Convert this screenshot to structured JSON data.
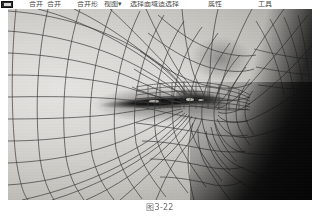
{
  "page": {
    "background_color": "#ffffff",
    "kind": "scanned-book-figure"
  },
  "toolbar": {
    "visible": true,
    "note": "cropped menu/toolbar strip, only bottom sliver of glyphs visible",
    "app_icon_name": "app-icon",
    "items": [
      {
        "label": "合并",
        "name": "toolbar-item-1"
      },
      {
        "label": "合并",
        "name": "toolbar-item-2"
      },
      {
        "label": "合并形",
        "name": "toolbar-item-3"
      },
      {
        "label": "视图▾",
        "name": "toolbar-item-4"
      },
      {
        "label": "选择面域适选择",
        "name": "toolbar-item-5"
      },
      {
        "label": "属性",
        "name": "toolbar-item-6"
      },
      {
        "label": "工具",
        "name": "toolbar-item-7"
      }
    ]
  },
  "figure": {
    "name": "wireframe-face-mesh-render",
    "alt": "Grayscale 3D wireframe mesh render of a human mouth and lips, quad polygon mesh overlaid on a shaded surface, dark background at right",
    "render_style": "shaded surface with quadrilateral wireframe overlay",
    "color_mode": "grayscale",
    "geometry": {
      "left": 8,
      "top": 9,
      "width": 304,
      "height": 191
    },
    "colors": {
      "skin_highlight": "#e6e4e1",
      "skin_mid": "#c2c0bb",
      "skin_shadow": "#999793",
      "mesh_line": "#3a3a3a",
      "mouth_opening": "#0c0c0c",
      "background_dark": "#0a0a0a"
    }
  },
  "caption": {
    "text": "图3-22",
    "name": "figure-caption"
  }
}
